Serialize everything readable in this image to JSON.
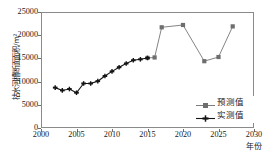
{
  "chart_data": {
    "type": "line",
    "title": "",
    "xlabel": "年份",
    "ylabel": "枯水河槽断面面积/m²",
    "xlim": [
      2000,
      2030
    ],
    "ylim": [
      0,
      25000
    ],
    "xticks": [
      2000,
      2005,
      2010,
      2015,
      2020,
      2025,
      2030
    ],
    "yticks": [
      0,
      5000,
      10000,
      15000,
      20000,
      25000
    ],
    "grid": false,
    "legend_position": "inside-bottom-right",
    "series": [
      {
        "name": "预测值",
        "color": "#6e6e6e",
        "marker": "square",
        "x": [
          2015,
          2016,
          2017,
          2020,
          2023,
          2025,
          2027
        ],
        "values": [
          15100,
          15200,
          21700,
          22200,
          14400,
          15300,
          21900
        ]
      },
      {
        "name": "实测值",
        "color": "#141414",
        "marker": "plus",
        "x": [
          2002,
          2003,
          2004,
          2005,
          2006,
          2007,
          2008,
          2009,
          2010,
          2011,
          2012,
          2013,
          2014,
          2015
        ],
        "values": [
          8700,
          8100,
          8400,
          7600,
          9600,
          9600,
          10100,
          11200,
          12200,
          13100,
          13900,
          14600,
          14800,
          15100
        ]
      }
    ]
  },
  "axis": {
    "x_tick_labels": [
      "2000",
      "2005",
      "2010",
      "2015",
      "2020",
      "2025",
      "2030"
    ],
    "y_tick_labels": [
      "0",
      "5000",
      "10000",
      "15000",
      "20000",
      "25000"
    ],
    "x_title": "年份",
    "y_title": "枯水河槽断面面积/m²"
  },
  "legend": {
    "items": [
      {
        "label": "预测值",
        "color": "#6e6e6e",
        "marker": "square"
      },
      {
        "label": "实测值",
        "color": "#141414",
        "marker": "plus"
      }
    ]
  }
}
